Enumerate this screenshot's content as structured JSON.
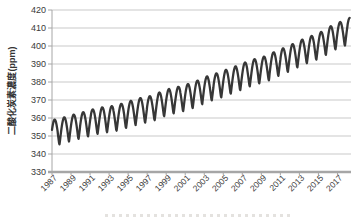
{
  "chart_data": {
    "type": "line",
    "title": "",
    "xlabel": "",
    "ylabel": "二酸化炭素濃度(ppm)",
    "ylim": [
      330,
      420
    ],
    "yticks": [
      420,
      410,
      400,
      390,
      380,
      370,
      360,
      350,
      340,
      330
    ],
    "xticks": [
      1987,
      1989,
      1991,
      1993,
      1995,
      1997,
      1999,
      2001,
      2003,
      2005,
      2007,
      2009,
      2011,
      2013,
      2015,
      2017
    ],
    "x_start": 1987,
    "x_end": 2018.32,
    "grid": "horizontal-only",
    "legend": "none",
    "series": [
      {
        "name": "monthly-co2-concentration",
        "years": [
          1987,
          1988,
          1989,
          1990,
          1991,
          1992,
          1993,
          1994,
          1995,
          1996,
          1997,
          1998,
          1999,
          2000,
          2001,
          2002,
          2003,
          2004,
          2005,
          2006,
          2007,
          2008,
          2009,
          2010,
          2011,
          2012,
          2013,
          2014,
          2015,
          2016,
          2017,
          2018
        ],
        "annual_mean_ppm": [
          351.8,
          353.4,
          354.9,
          356.2,
          357.8,
          358.9,
          359.4,
          360.9,
          362.6,
          364.1,
          365.0,
          367.4,
          369.2,
          370.3,
          371.9,
          373.9,
          376.3,
          377.8,
          379.9,
          381.8,
          384.0,
          385.8,
          387.1,
          389.8,
          391.8,
          394.3,
          396.8,
          398.7,
          401.0,
          404.4,
          406.5,
          408.8
        ],
        "seasonal_amplitude_ppm": 7.3,
        "seasonal_peak_month": "April",
        "seasonal_trough_month": "October",
        "start_value_ppm": 353,
        "end_peak_value_ppm": 415
      }
    ],
    "colors": {
      "line": "#373737",
      "gridline": "#c9c9c9",
      "axis": "#a6a6a6",
      "tick_label": "#3a3a3a"
    }
  }
}
